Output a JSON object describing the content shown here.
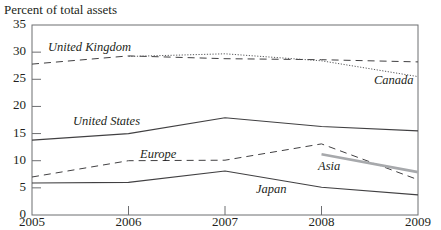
{
  "chart_data": {
    "type": "line",
    "title": "",
    "ylabel": "Percent of total assets",
    "xlabel": "",
    "x": [
      2005,
      2006,
      2007,
      2008,
      2009
    ],
    "ylim": [
      0,
      35
    ],
    "yticks": [
      0,
      5,
      10,
      15,
      20,
      25,
      30,
      35
    ],
    "xticks": [
      "2005",
      "2006",
      "2007",
      "2008",
      "2009"
    ],
    "grid": false,
    "legend": "inline labels",
    "series": [
      {
        "name": "United Kingdom",
        "style": "dashed",
        "color": "#231f20",
        "values": [
          27.8,
          29.3,
          28.8,
          28.6,
          28.2
        ]
      },
      {
        "name": "Canada",
        "style": "dotted",
        "color": "#231f20",
        "values": [
          null,
          29.2,
          29.7,
          28.4,
          25.5
        ]
      },
      {
        "name": "United States",
        "style": "solid",
        "color": "#231f20",
        "values": [
          13.8,
          15.0,
          17.9,
          16.3,
          15.5
        ]
      },
      {
        "name": "Europe",
        "style": "dashed",
        "color": "#231f20",
        "values": [
          7.0,
          10.0,
          10.1,
          13.1,
          6.5
        ]
      },
      {
        "name": "Asia",
        "style": "solid-thick-gray",
        "color": "#a7a9ac",
        "values": [
          null,
          null,
          null,
          11.2,
          7.9
        ]
      },
      {
        "name": "Japan",
        "style": "solid",
        "color": "#231f20",
        "values": [
          5.9,
          6.0,
          8.1,
          5.1,
          3.7
        ]
      }
    ]
  },
  "labels": {
    "ylabel": "Percent of total assets",
    "uk": "United Kingdom",
    "canada": "Canada",
    "us": "United States",
    "europe": "Europe",
    "asia": "Asia",
    "japan": "Japan"
  }
}
